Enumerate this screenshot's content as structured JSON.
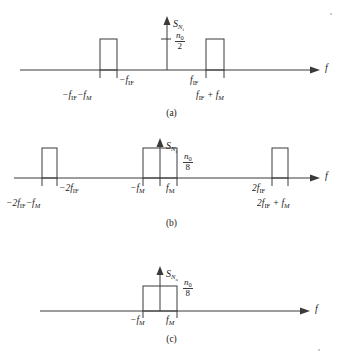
{
  "figure": {
    "type": "signal-spectrum-diagram",
    "axis_label_x": "f",
    "panels": [
      {
        "id": "a",
        "caption": "(a)",
        "y_axis_label": "S",
        "y_axis_sub": "N",
        "y_axis_sub2": "i",
        "level_numerator": "n",
        "level_numerator_sub": "0",
        "level_denominator": "2",
        "level_text": "n0/2",
        "pulses": [
          {
            "name": "negative-if-band",
            "center_label": "-f_IF",
            "left_edge_label": "-f_IF - f_M",
            "x_left": 100,
            "x_right": 117,
            "height": 31
          },
          {
            "name": "positive-if-band",
            "center_label": "f_IF",
            "right_edge_label": "f_IF + f_M",
            "x_left": 206,
            "x_right": 224,
            "height": 31
          }
        ],
        "tick_labels": [
          "-f_IF",
          "-f_IF - f_M",
          "f_IF",
          "f_IF + f_M"
        ]
      },
      {
        "id": "b",
        "caption": "(b)",
        "y_axis_label": "S",
        "y_axis_sub": "N",
        "y_axis_sub2": "i",
        "level_numerator": "n",
        "level_numerator_sub": "0",
        "level_denominator": "8",
        "level_text": "n0/8",
        "pulses": [
          {
            "name": "negative-2if-band",
            "center_label": "-2f_IF",
            "left_edge_label": "-2f_IF - f_M",
            "x_left": 42,
            "x_right": 57,
            "height": 30
          },
          {
            "name": "baseband",
            "left_label": "-f_M",
            "right_label": "f_M",
            "x_left": 143,
            "x_right": 177,
            "height": 30
          },
          {
            "name": "positive-2if-band",
            "center_label": "2f_IF",
            "right_edge_label": "2f_IF + f_M",
            "x_left": 272,
            "x_right": 288,
            "height": 30
          }
        ],
        "tick_labels": [
          "-2f_IF",
          "-2f_IF - f_M",
          "-f_M",
          "f_M",
          "2f_IF",
          "2f_IF + f_M"
        ]
      },
      {
        "id": "c",
        "caption": "(c)",
        "y_axis_label": "S",
        "y_axis_sub": "N",
        "y_axis_sub2": "o",
        "level_numerator": "n",
        "level_numerator_sub": "0",
        "level_denominator": "8",
        "level_text": "n0/8",
        "pulses": [
          {
            "name": "baseband-output",
            "left_label": "-f_M",
            "right_label": "f_M",
            "x_left": 143,
            "x_right": 177,
            "height": 25
          }
        ],
        "tick_labels": [
          "-f_M",
          "f_M"
        ]
      }
    ]
  },
  "labels": {
    "f": "f",
    "minus": "−",
    "neg_f_IF": "f",
    "sub_IF": "IF",
    "sub_M": "M",
    "sub_0": "0",
    "two": "2",
    "eight": "8",
    "n": "n",
    "S": "S",
    "N": "N",
    "i": "i",
    "o": "o",
    "cap_a": "(a)",
    "cap_b": "(b)",
    "cap_c": "(c)"
  },
  "colors": {
    "stroke": "#3a3a3a",
    "text": "#1a1a1a",
    "background": "#ffffff"
  }
}
